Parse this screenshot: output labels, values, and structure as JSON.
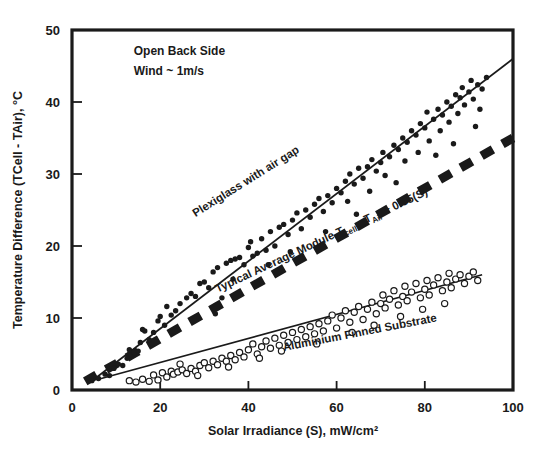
{
  "chart_data": {
    "type": "scatter",
    "title": "",
    "xlabel": "Solar Irradiance (S), mW/cm²",
    "ylabel": "Temperature Difference (TCell - TAir), °C",
    "xlim": [
      0,
      100
    ],
    "ylim": [
      0,
      50
    ],
    "xticks": [
      0,
      20,
      40,
      60,
      80,
      100
    ],
    "yticks": [
      0,
      10,
      20,
      30,
      40,
      50
    ],
    "grid": false,
    "legend": "inline-annotations",
    "annotations": [
      {
        "name": "condition-line-1",
        "text": "Open Back Side",
        "x": 14,
        "y": 46.5
      },
      {
        "name": "condition-line-2",
        "text": "Wind ~ 1m/s",
        "x": 14,
        "y": 43.8
      }
    ],
    "series": [
      {
        "name": "Plexiglass with air gap",
        "marker": "filled-circle",
        "label": "Plexiglass with air gap",
        "label_x": 28,
        "label_y": 24,
        "label_rotation": -32,
        "fit_line": {
          "x": [
            5,
            100
          ],
          "y": [
            1.5,
            46.0
          ]
        },
        "points": [
          [
            4.5,
            1.3
          ],
          [
            6.0,
            1.6
          ],
          [
            7.5,
            2.2
          ],
          [
            8.5,
            2.0
          ],
          [
            9.5,
            3.0
          ],
          [
            10.5,
            3.6
          ],
          [
            11.5,
            3.4
          ],
          [
            12.5,
            4.4
          ],
          [
            13.0,
            5.6
          ],
          [
            14.0,
            5.2
          ],
          [
            15.0,
            5.4
          ],
          [
            15.5,
            6.6
          ],
          [
            16.0,
            8.4
          ],
          [
            16.5,
            8.2
          ],
          [
            17.5,
            7.0
          ],
          [
            18.5,
            8.0
          ],
          [
            19.5,
            9.6
          ],
          [
            20.0,
            10.2
          ],
          [
            21.0,
            9.0
          ],
          [
            21.5,
            11.6
          ],
          [
            22.5,
            10.4
          ],
          [
            23.5,
            11.0
          ],
          [
            24.5,
            12.0
          ],
          [
            26.0,
            12.8
          ],
          [
            27.0,
            13.4
          ],
          [
            28.0,
            13.0
          ],
          [
            29.0,
            14.8
          ],
          [
            30.0,
            15.0
          ],
          [
            31.0,
            14.2
          ],
          [
            32.0,
            16.4
          ],
          [
            33.0,
            17.0
          ],
          [
            34.0,
            12.8
          ],
          [
            35.0,
            17.6
          ],
          [
            36.0,
            18.0
          ],
          [
            37.0,
            18.2
          ],
          [
            38.0,
            18.4
          ],
          [
            39.0,
            17.4
          ],
          [
            40.0,
            19.8
          ],
          [
            40.5,
            20.6
          ],
          [
            41.0,
            18.6
          ],
          [
            42.0,
            19.0
          ],
          [
            43.0,
            21.0
          ],
          [
            44.0,
            19.4
          ],
          [
            45.0,
            22.0
          ],
          [
            46.0,
            20.0
          ],
          [
            47.0,
            22.6
          ],
          [
            48.0,
            23.0
          ],
          [
            49.0,
            21.6
          ],
          [
            50.0,
            23.6
          ],
          [
            51.0,
            24.6
          ],
          [
            52.0,
            22.4
          ],
          [
            53.0,
            25.0
          ],
          [
            54.0,
            24.0
          ],
          [
            55.0,
            25.8
          ],
          [
            56.0,
            26.6
          ],
          [
            57.0,
            24.8
          ],
          [
            58.0,
            27.0
          ],
          [
            59.0,
            26.0
          ],
          [
            60.0,
            28.0
          ],
          [
            61.0,
            27.4
          ],
          [
            62.0,
            29.0
          ],
          [
            62.5,
            26.2
          ],
          [
            63.0,
            30.0
          ],
          [
            64.0,
            28.6
          ],
          [
            65.0,
            30.8
          ],
          [
            66.0,
            29.4
          ],
          [
            67.0,
            31.0
          ],
          [
            67.5,
            27.6
          ],
          [
            68.0,
            32.0
          ],
          [
            69.0,
            30.4
          ],
          [
            70.0,
            31.6
          ],
          [
            70.5,
            33.0
          ],
          [
            71.0,
            29.8
          ],
          [
            72.0,
            32.4
          ],
          [
            73.0,
            34.0
          ],
          [
            74.0,
            33.4
          ],
          [
            75.0,
            35.0
          ],
          [
            75.5,
            31.8
          ],
          [
            76.0,
            34.4
          ],
          [
            77.0,
            36.0
          ],
          [
            78.0,
            35.4
          ],
          [
            78.5,
            33.0
          ],
          [
            79.0,
            37.0
          ],
          [
            80.0,
            36.4
          ],
          [
            80.5,
            38.6
          ],
          [
            81.0,
            34.6
          ],
          [
            82.0,
            37.6
          ],
          [
            83.0,
            39.0
          ],
          [
            83.5,
            36.0
          ],
          [
            84.0,
            38.2
          ],
          [
            85.0,
            40.0
          ],
          [
            85.5,
            37.2
          ],
          [
            86.0,
            39.4
          ],
          [
            87.0,
            41.0
          ],
          [
            87.5,
            38.4
          ],
          [
            88.0,
            40.6
          ],
          [
            88.5,
            42.0
          ],
          [
            89.0,
            39.6
          ],
          [
            90.0,
            41.4
          ],
          [
            90.5,
            43.0
          ],
          [
            91.0,
            40.4
          ],
          [
            92.0,
            42.4
          ],
          [
            92.5,
            39.0
          ],
          [
            93.0,
            41.8
          ],
          [
            94.0,
            43.4
          ],
          [
            32.5,
            10.6
          ],
          [
            36.5,
            15.4
          ],
          [
            44.5,
            17.4
          ],
          [
            49.5,
            19.2
          ],
          [
            57.5,
            22.0
          ],
          [
            64.5,
            24.4
          ],
          [
            73.5,
            28.8
          ],
          [
            82.5,
            32.6
          ],
          [
            86.5,
            34.2
          ],
          [
            91.5,
            36.6
          ]
        ]
      },
      {
        "name": "Typical Average Module",
        "marker": "dashed-line",
        "label": "Typical Average Module T",
        "label_sub_1": "cell",
        "label_mid": " - T",
        "label_sub_2": "Air",
        "label_end": " + 0.35(S)",
        "label_x": 33,
        "label_y": 13.5,
        "label_rotation": -25,
        "formula": "T_cell - T_Air + 0.35(S)",
        "fit_line": {
          "x": [
            3,
            100
          ],
          "y": [
            1.2,
            35.0
          ]
        }
      },
      {
        "name": "Aluminium Finned Substrate",
        "marker": "open-circle",
        "label": "Aluminium Finned Substrate",
        "label_x": 48,
        "label_y": 5.4,
        "label_rotation": -11,
        "fit_line": {
          "x": [
            6,
            93
          ],
          "y": [
            1.5,
            16.0
          ]
        },
        "points": [
          [
            13.0,
            1.3
          ],
          [
            14.5,
            1.1
          ],
          [
            16.0,
            1.5
          ],
          [
            17.5,
            1.2
          ],
          [
            18.5,
            2.1
          ],
          [
            19.5,
            1.4
          ],
          [
            20.5,
            2.4
          ],
          [
            21.5,
            1.8
          ],
          [
            22.5,
            2.6
          ],
          [
            23.0,
            2.2
          ],
          [
            24.0,
            2.5
          ],
          [
            25.0,
            2.8
          ],
          [
            26.0,
            2.3
          ],
          [
            27.0,
            3.0
          ],
          [
            28.0,
            2.6
          ],
          [
            29.0,
            3.4
          ],
          [
            30.0,
            3.8
          ],
          [
            31.0,
            3.1
          ],
          [
            32.0,
            4.0
          ],
          [
            33.0,
            3.5
          ],
          [
            34.0,
            4.4
          ],
          [
            35.0,
            4.0
          ],
          [
            36.0,
            4.8
          ],
          [
            37.0,
            4.2
          ],
          [
            38.0,
            5.2
          ],
          [
            39.0,
            4.6
          ],
          [
            40.0,
            5.6
          ],
          [
            41.0,
            6.4
          ],
          [
            42.0,
            5.0
          ],
          [
            43.0,
            6.0
          ],
          [
            44.0,
            6.8
          ],
          [
            45.0,
            5.8
          ],
          [
            46.0,
            7.2
          ],
          [
            47.0,
            6.2
          ],
          [
            48.0,
            7.6
          ],
          [
            49.0,
            6.6
          ],
          [
            50.0,
            8.0
          ],
          [
            51.0,
            7.0
          ],
          [
            52.0,
            8.4
          ],
          [
            53.0,
            7.4
          ],
          [
            54.0,
            8.8
          ],
          [
            55.0,
            7.8
          ],
          [
            56.0,
            9.2
          ],
          [
            57.0,
            8.2
          ],
          [
            58.0,
            9.6
          ],
          [
            59.0,
            10.4
          ],
          [
            60.0,
            8.6
          ],
          [
            61.0,
            10.0
          ],
          [
            62.0,
            11.0
          ],
          [
            63.0,
            9.4
          ],
          [
            64.0,
            10.8
          ],
          [
            65.0,
            11.6
          ],
          [
            66.0,
            9.8
          ],
          [
            67.0,
            11.2
          ],
          [
            68.0,
            12.2
          ],
          [
            69.0,
            10.6
          ],
          [
            70.0,
            12.0
          ],
          [
            70.5,
            13.2
          ],
          [
            71.0,
            11.4
          ],
          [
            72.0,
            12.6
          ],
          [
            73.0,
            13.8
          ],
          [
            74.0,
            11.8
          ],
          [
            75.0,
            13.0
          ],
          [
            75.5,
            14.4
          ],
          [
            76.0,
            12.4
          ],
          [
            77.0,
            13.6
          ],
          [
            78.0,
            14.8
          ],
          [
            79.0,
            12.8
          ],
          [
            80.0,
            14.0
          ],
          [
            80.5,
            15.2
          ],
          [
            81.0,
            13.2
          ],
          [
            82.0,
            14.6
          ],
          [
            83.0,
            15.6
          ],
          [
            84.0,
            13.8
          ],
          [
            85.0,
            15.0
          ],
          [
            85.5,
            16.2
          ],
          [
            86.0,
            14.2
          ],
          [
            87.0,
            15.4
          ],
          [
            88.0,
            16.0
          ],
          [
            89.0,
            14.8
          ],
          [
            90.0,
            15.8
          ],
          [
            91.0,
            16.4
          ],
          [
            92.0,
            15.2
          ],
          [
            24.5,
            3.6
          ],
          [
            28.5,
            2.0
          ],
          [
            35.5,
            3.2
          ],
          [
            42.5,
            4.4
          ],
          [
            47.5,
            5.4
          ],
          [
            55.5,
            6.4
          ],
          [
            63.5,
            8.0
          ],
          [
            68.5,
            9.0
          ],
          [
            74.5,
            10.2
          ],
          [
            79.5,
            11.2
          ],
          [
            84.5,
            12.0
          ]
        ]
      }
    ]
  },
  "colors": {
    "ink": "#1a1a1a",
    "axis": "#111111",
    "background": "#ffffff"
  }
}
